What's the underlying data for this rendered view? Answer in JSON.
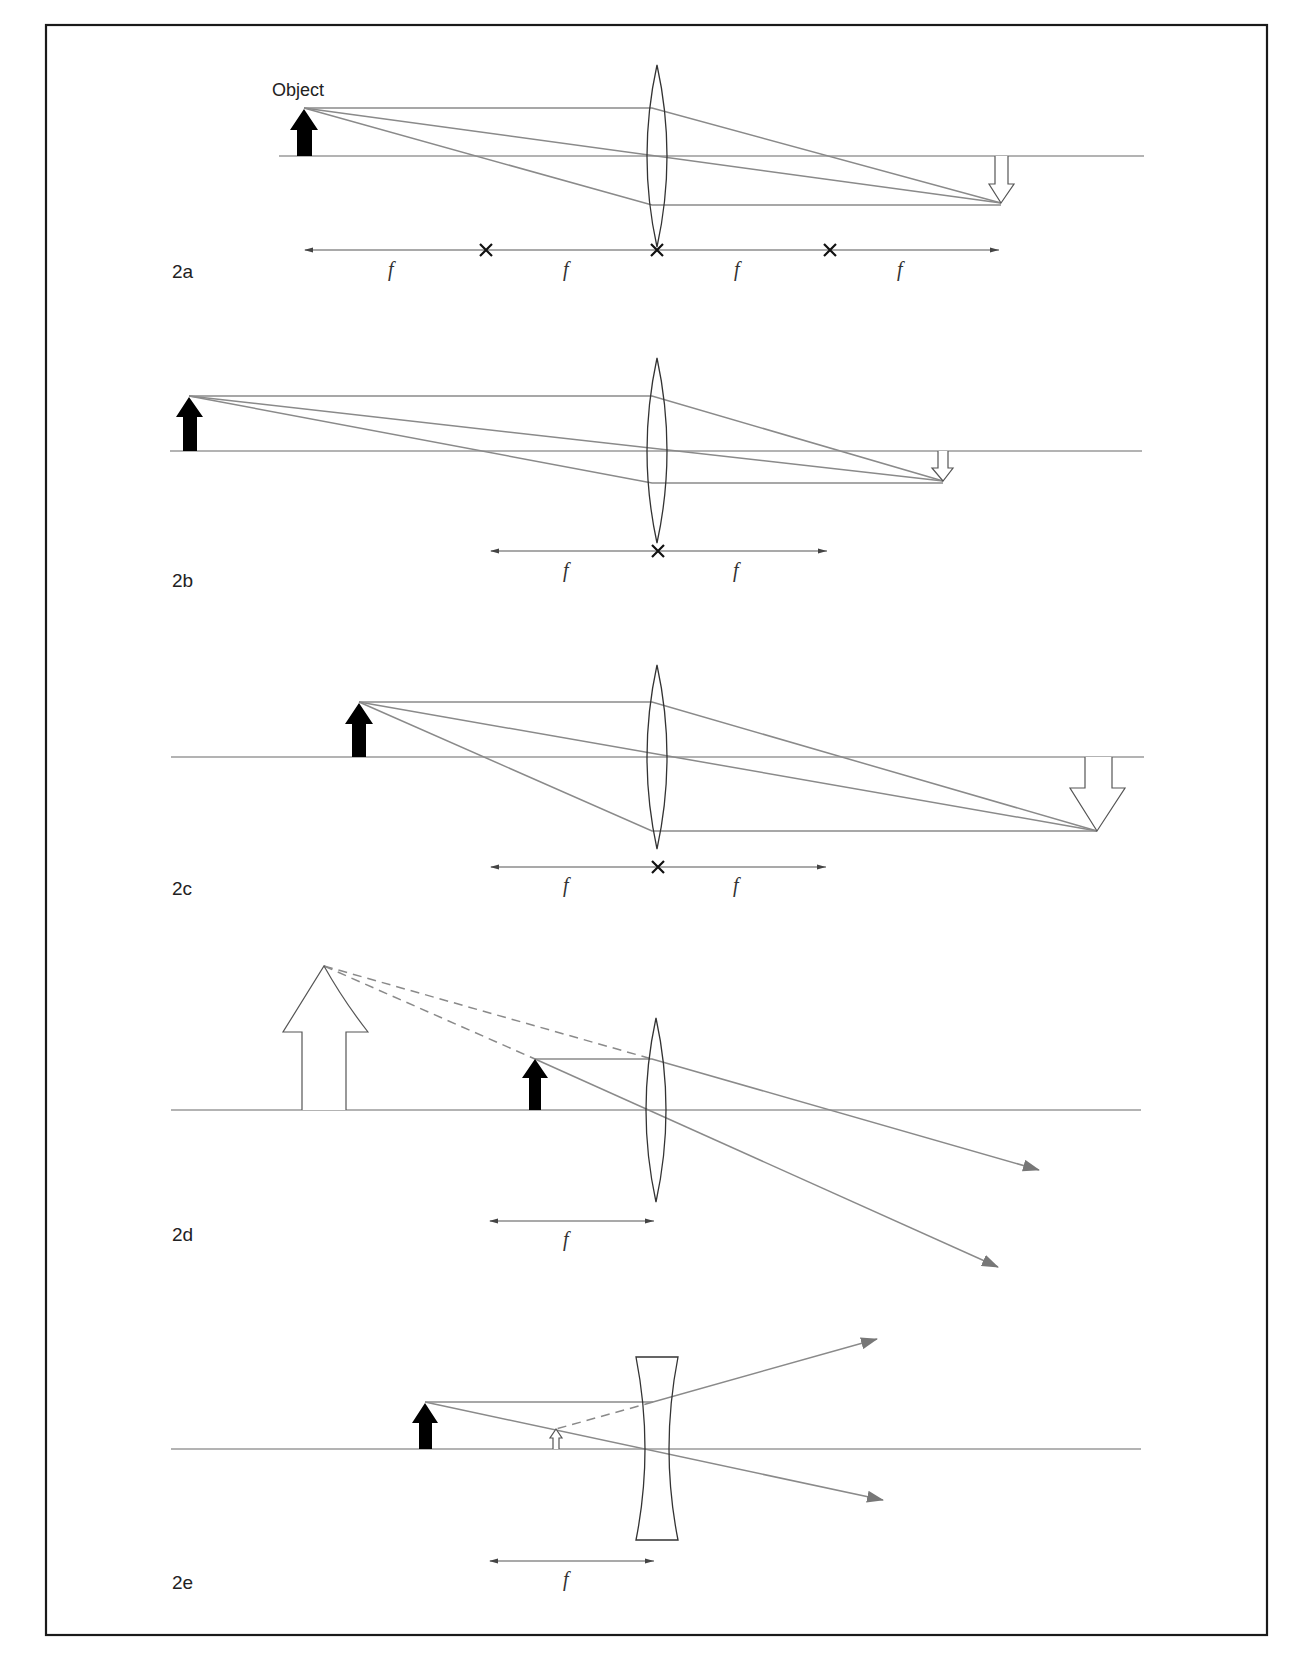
{
  "figure": {
    "frame": {
      "x": 46,
      "y": 25,
      "w": 1221,
      "h": 1610
    },
    "colors": {
      "ray": "#8a8a8a",
      "axis": "#9a9a9a",
      "lens": "#333333",
      "object": "#000000",
      "frame": "#1a1a1a"
    },
    "panels": [
      {
        "id": "2a",
        "label": "2a",
        "object_label": "Object",
        "lens_type": "converging",
        "f_labels": [
          "f",
          "f",
          "f",
          "f"
        ],
        "description": "Object at 2f, real inverted image at 2f"
      },
      {
        "id": "2b",
        "label": "2b",
        "lens_type": "converging",
        "f_labels": [
          "f",
          "f"
        ],
        "description": "Object beyond 2f, real inverted diminished image"
      },
      {
        "id": "2c",
        "label": "2c",
        "lens_type": "converging",
        "f_labels": [
          "f",
          "f"
        ],
        "description": "Object between f and 2f, real inverted magnified image"
      },
      {
        "id": "2d",
        "label": "2d",
        "lens_type": "converging",
        "f_labels": [
          "f"
        ],
        "description": "Object inside f, virtual upright magnified image"
      },
      {
        "id": "2e",
        "label": "2e",
        "lens_type": "diverging",
        "f_labels": [
          "f"
        ],
        "description": "Diverging lens, virtual upright diminished image"
      }
    ]
  }
}
